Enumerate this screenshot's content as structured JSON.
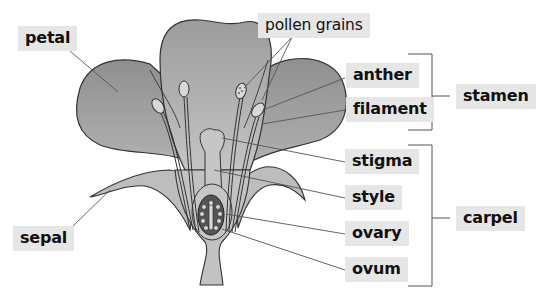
{
  "colors": {
    "petal_fill": "#9a9a9a",
    "petal_fill_light": "#b4b4b4",
    "sepal_fill": "#bdbdbd",
    "ovary_fill": "#555555",
    "outline": "#333333",
    "label_bg": "#e6e6e6",
    "leader_line": "#555555"
  },
  "labels": {
    "petal": "petal",
    "pollen_grains": "pollen grains",
    "anther": "anther",
    "filament": "filament",
    "stamen": "stamen",
    "stigma": "stigma",
    "style": "style",
    "carpel": "carpel",
    "sepal": "sepal",
    "ovary": "ovary",
    "ovum": "ovum"
  },
  "groups": {
    "stamen": [
      "anther",
      "filament"
    ],
    "carpel": [
      "stigma",
      "style",
      "ovary",
      "ovum"
    ]
  }
}
